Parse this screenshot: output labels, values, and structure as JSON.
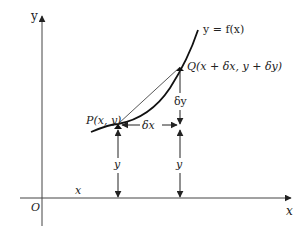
{
  "diagram": {
    "axes": {
      "x_label": "x",
      "y_label": "y",
      "origin_label": "O"
    },
    "curve_label": "y = f(x)",
    "points": {
      "P": {
        "label": "P(x, y)"
      },
      "Q": {
        "label": "Q(x + δx, y + δy)"
      }
    },
    "increments": {
      "dx_label": "δx",
      "dy_label": "δy"
    },
    "heights": {
      "p_height_label": "y",
      "q_height_label": "y"
    },
    "x_distance_label": "x",
    "colors": {
      "line": "#222222",
      "axis": "#555555",
      "background": "#ffffff"
    }
  }
}
